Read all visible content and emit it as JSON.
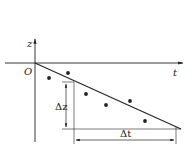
{
  "diagram": {
    "type": "scatter-with-fit-line",
    "axes": {
      "vertical_label": "z",
      "horizontal_label": "t",
      "origin_label": "O"
    },
    "fit_line": {
      "from": [
        35,
        63
      ],
      "to": [
        181,
        129
      ]
    },
    "points": [
      [
        49,
        78
      ],
      [
        68,
        73
      ],
      [
        86,
        94
      ],
      [
        106,
        105
      ],
      [
        130,
        101
      ],
      [
        145,
        121
      ]
    ],
    "annotations": {
      "delta_z": "Δz",
      "delta_t": "Δt"
    },
    "colors": {
      "stroke": "#222222",
      "background": "#ffffff"
    }
  }
}
